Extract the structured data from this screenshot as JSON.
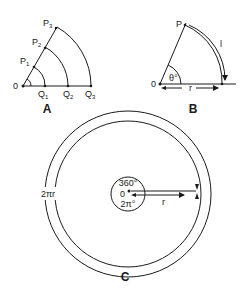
{
  "panels": {
    "A": {
      "caption": "A",
      "origin_label": "0",
      "points_on_ray": [
        {
          "label": "P",
          "sub": "1"
        },
        {
          "label": "P",
          "sub": "2"
        },
        {
          "label": "P",
          "sub": "3"
        }
      ],
      "points_on_base": [
        {
          "label": "Q",
          "sub": "1"
        },
        {
          "label": "Q",
          "sub": "2"
        },
        {
          "label": "Q",
          "sub": "3"
        }
      ]
    },
    "B": {
      "caption": "B",
      "origin_label": "0",
      "point_label": "P",
      "angle_label": "θ°",
      "arc_label": "l",
      "radius_label": "r"
    },
    "C": {
      "caption": "C",
      "center_label": "0",
      "degrees_label": "360°",
      "radians_label": "2π°",
      "circumference_label": "2πr",
      "radius_label": "r"
    }
  },
  "colors": {
    "ink": "#1a1a1a",
    "background": "#ffffff"
  }
}
